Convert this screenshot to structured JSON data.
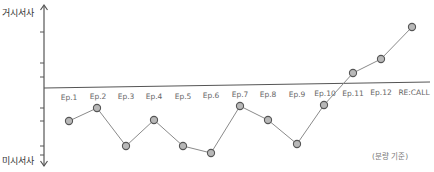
{
  "chart_data": {
    "type": "line",
    "title": "",
    "xlabel": "",
    "ylabel_top": "거시서사",
    "ylabel_bottom": "미시서사",
    "note": "(분량 기준)",
    "categories": [
      "Ep.1",
      "Ep.2",
      "Ep.3",
      "Ep.4",
      "Ep.5",
      "Ep.6",
      "Ep.7",
      "Ep.8",
      "Ep.9",
      "Ep.10",
      "Ep.11",
      "Ep.12",
      "RE:CALL"
    ],
    "series": [
      {
        "name": "narrative-scale",
        "values": [
          -3.3,
          -2.0,
          -5.8,
          -3.2,
          -5.8,
          -6.5,
          -1.8,
          -3.2,
          -5.6,
          -1.7,
          1.2,
          2.5,
          5.6
        ]
      }
    ],
    "ylim": [
      -8,
      8
    ],
    "grid": false,
    "legend": "none",
    "colors": {
      "axis": "#555555",
      "line": "#8a8a8a",
      "marker_fill": "#b8b8b8",
      "marker_stroke": "#555555",
      "label": "#666666"
    },
    "pixel_points": [
      [
        69,
        121
      ],
      [
        97,
        108
      ],
      [
        126,
        146
      ],
      [
        154,
        120
      ],
      [
        183,
        146
      ],
      [
        211,
        153
      ],
      [
        240,
        106
      ],
      [
        268,
        120
      ],
      [
        297,
        144
      ],
      [
        324,
        105
      ],
      [
        353,
        73
      ],
      [
        381,
        59
      ],
      [
        412,
        27
      ]
    ],
    "label_positions": [
      [
        69,
        100
      ],
      [
        98,
        99
      ],
      [
        126,
        99
      ],
      [
        154,
        99
      ],
      [
        183,
        99
      ],
      [
        211,
        98
      ],
      [
        240,
        97
      ],
      [
        268,
        97
      ],
      [
        297,
        97
      ],
      [
        325,
        96
      ],
      [
        353,
        96
      ],
      [
        381,
        95
      ],
      [
        414,
        95
      ]
    ]
  }
}
